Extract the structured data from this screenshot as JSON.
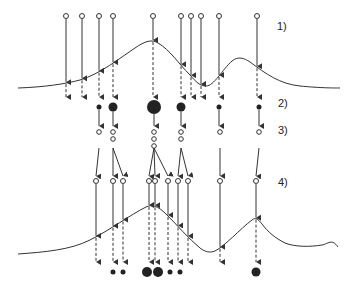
{
  "labels": {
    "step1": "1)",
    "step2": "2)",
    "step3": "3)",
    "step4": "4)"
  },
  "colors": {
    "stroke": "#333333",
    "fill": "#222222"
  },
  "stage1": {
    "sample_x": [
      66,
      82,
      99,
      113,
      153,
      181,
      191,
      201,
      219,
      257
    ],
    "weights_dots": [
      {
        "x": 99,
        "r": 2.5
      },
      {
        "x": 113,
        "r": 4.5
      },
      {
        "x": 154,
        "r": 7
      },
      {
        "x": 181,
        "r": 4.5
      },
      {
        "x": 219,
        "r": 2.5
      },
      {
        "x": 259,
        "r": 2.5
      }
    ]
  },
  "stage3": {
    "resampled": [
      {
        "x": 99,
        "count": 1
      },
      {
        "x": 113,
        "count": 2
      },
      {
        "x": 154,
        "count": 3
      },
      {
        "x": 181,
        "count": 2
      },
      {
        "x": 220,
        "count": 1
      },
      {
        "x": 259,
        "count": 1
      }
    ]
  },
  "stage4": {
    "sample_x": [
      96,
      113,
      123,
      149,
      155,
      168,
      178,
      188,
      220,
      256
    ],
    "weights_dots": [
      {
        "x": 113,
        "r": 2.5
      },
      {
        "x": 123,
        "r": 2.5
      },
      {
        "x": 147,
        "r": 5
      },
      {
        "x": 158,
        "r": 5
      },
      {
        "x": 170,
        "r": 2.5
      },
      {
        "x": 180,
        "r": 2.5
      },
      {
        "x": 256,
        "r": 4.5
      }
    ]
  }
}
